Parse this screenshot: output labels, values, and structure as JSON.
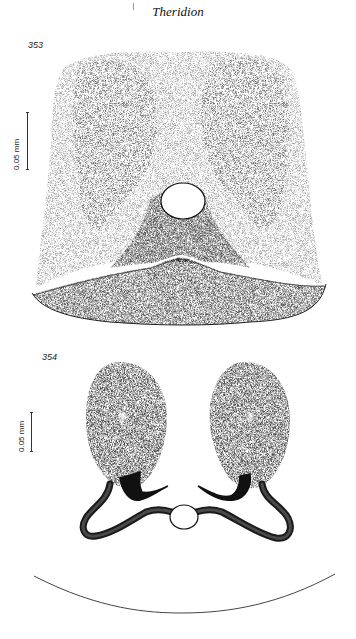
{
  "header": {
    "title": "Theridion"
  },
  "figures": [
    {
      "number": "353",
      "scale_label": "0.05 mm",
      "description": "stippled epigynum plate, ventral view"
    },
    {
      "number": "354",
      "scale_label": "0.05 mm",
      "description": "spermathecae and ducts, dorsal view"
    }
  ],
  "colors": {
    "ink": "#222222",
    "background": "#ffffff"
  }
}
